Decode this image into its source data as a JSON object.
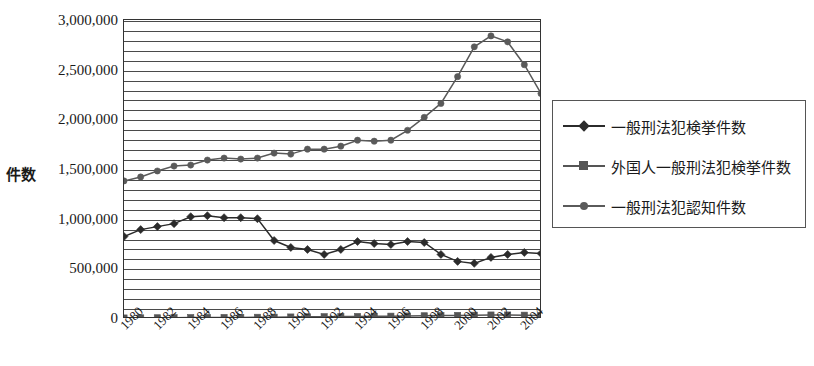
{
  "chart_data": {
    "type": "line",
    "title": "",
    "xlabel": "",
    "ylabel": "件数",
    "ylim": [
      0,
      3000000
    ],
    "ytick_step": 500000,
    "gridline_step": 100000,
    "grid": true,
    "legend_position": "right",
    "y_tick_labels": [
      "3,000,000",
      "2,500,000",
      "2,000,000",
      "1,500,000",
      "1,000,000",
      "500,000",
      "0"
    ],
    "y_tick_values": [
      3000000,
      2500000,
      2000000,
      1500000,
      1000000,
      500000,
      0
    ],
    "x": [
      1980,
      1981,
      1982,
      1983,
      1984,
      1985,
      1986,
      1987,
      1988,
      1989,
      1990,
      1991,
      1992,
      1993,
      1994,
      1995,
      1996,
      1997,
      1998,
      1999,
      2000,
      2001,
      2002,
      2003,
      2004,
      2005
    ],
    "x_tick_labels": [
      "1980",
      "1982",
      "1984",
      "1986",
      "1988",
      "1990",
      "1992",
      "1994",
      "1996",
      "1998",
      "2000",
      "2002",
      "2004"
    ],
    "x_tick_values": [
      1980,
      1982,
      1984,
      1986,
      1988,
      1990,
      1992,
      1994,
      1996,
      1998,
      2000,
      2002,
      2004
    ],
    "series": [
      {
        "name": "一般刑法犯検挙件数",
        "marker": "diamond",
        "color": "#2b2b2b",
        "values": [
          830000,
          900000,
          930000,
          960000,
          1030000,
          1040000,
          1020000,
          1020000,
          1010000,
          790000,
          720000,
          700000,
          650000,
          700000,
          780000,
          760000,
          750000,
          780000,
          770000,
          650000,
          580000,
          560000,
          620000,
          650000,
          670000,
          660000
        ]
      },
      {
        "name": "外国人一般刑法犯検挙件数",
        "marker": "square",
        "color": "#555555",
        "values": [
          10000,
          11000,
          12000,
          13000,
          14000,
          15000,
          15000,
          16000,
          17000,
          18000,
          20000,
          22000,
          23000,
          24000,
          25000,
          27000,
          28000,
          30000,
          32000,
          34000,
          36000,
          38000,
          40000,
          40000,
          38000,
          36000
        ]
      },
      {
        "name": "一般刑法犯認知件数",
        "marker": "circle",
        "color": "#5a5a5a",
        "values": [
          1390000,
          1430000,
          1490000,
          1540000,
          1550000,
          1600000,
          1620000,
          1610000,
          1620000,
          1670000,
          1660000,
          1710000,
          1710000,
          1740000,
          1800000,
          1790000,
          1800000,
          1900000,
          2030000,
          2170000,
          2440000,
          2740000,
          2850000,
          2790000,
          2560000,
          2270000
        ]
      }
    ]
  },
  "legend": {
    "items": [
      {
        "label": "一般刑法犯検挙件数",
        "marker": "diamond-marker",
        "color": "#2b2b2b"
      },
      {
        "label": "外国人一般刑法犯検挙件数",
        "marker": "square-marker",
        "color": "#555555"
      },
      {
        "label": "一般刑法犯認知件数",
        "marker": "circle-marker",
        "color": "#5a5a5a"
      }
    ]
  }
}
